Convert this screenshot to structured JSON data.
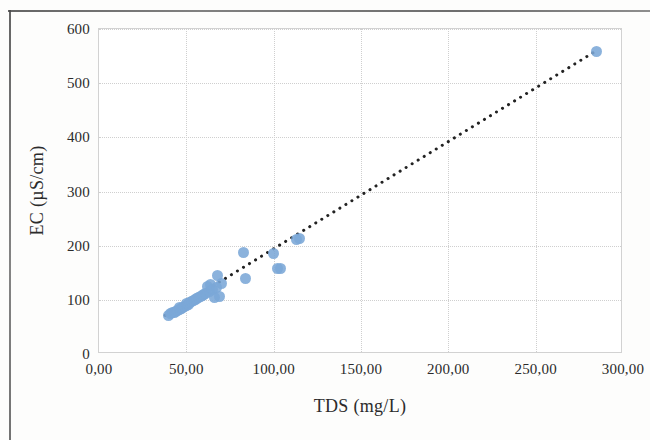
{
  "chart_data": {
    "type": "scatter",
    "title": "",
    "xlabel": "TDS (mg/L)",
    "ylabel": "EC (µS/cm)",
    "xlim": [
      0,
      300
    ],
    "ylim": [
      0,
      600
    ],
    "xticks": [
      "0,00",
      "50,00",
      "100,00",
      "150,00",
      "200,00",
      "250,00",
      "300,00"
    ],
    "xtick_values": [
      0,
      50,
      100,
      150,
      200,
      250,
      300
    ],
    "yticks": [
      "0",
      "100",
      "200",
      "300",
      "400",
      "500",
      "600"
    ],
    "ytick_values": [
      0,
      100,
      200,
      300,
      400,
      500,
      600
    ],
    "grid": true,
    "legend": "none",
    "marker_color": "#7ba7d7",
    "trendline": {
      "style": "dotted",
      "color": "#222222",
      "x_start": 38,
      "y_start": 68,
      "x_end": 285,
      "y_end": 558
    },
    "series": [
      {
        "name": "EC vs TDS",
        "points": [
          [
            40,
            72
          ],
          [
            41,
            74
          ],
          [
            42,
            76
          ],
          [
            43,
            77
          ],
          [
            44,
            78
          ],
          [
            45,
            80
          ],
          [
            46,
            82
          ],
          [
            46,
            85
          ],
          [
            47,
            84
          ],
          [
            48,
            86
          ],
          [
            49,
            88
          ],
          [
            50,
            90
          ],
          [
            50,
            93
          ],
          [
            51,
            92
          ],
          [
            52,
            95
          ],
          [
            53,
            97
          ],
          [
            54,
            99
          ],
          [
            55,
            100
          ],
          [
            56,
            102
          ],
          [
            57,
            104
          ],
          [
            58,
            106
          ],
          [
            59,
            108
          ],
          [
            60,
            110
          ],
          [
            61,
            112
          ],
          [
            62,
            124
          ],
          [
            63,
            116
          ],
          [
            64,
            128
          ],
          [
            65,
            120
          ],
          [
            66,
            105
          ],
          [
            67,
            122
          ],
          [
            68,
            145
          ],
          [
            69,
            106
          ],
          [
            70,
            130
          ],
          [
            83,
            188
          ],
          [
            84,
            140
          ],
          [
            100,
            185
          ],
          [
            102,
            158
          ],
          [
            104,
            157
          ],
          [
            113,
            212
          ],
          [
            115,
            213
          ],
          [
            285,
            558
          ]
        ]
      }
    ]
  }
}
